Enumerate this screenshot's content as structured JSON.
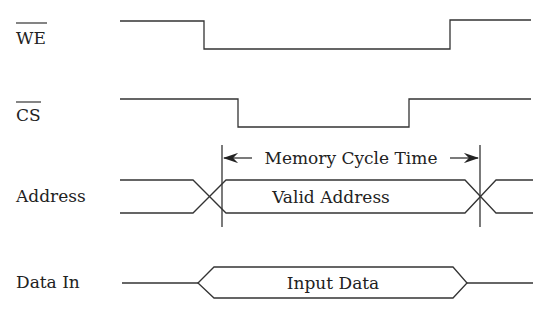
{
  "diagram": {
    "type": "timing-diagram",
    "signals": [
      {
        "name": "WE",
        "active_low": true,
        "label": "WE"
      },
      {
        "name": "CS",
        "active_low": true,
        "label": "CS"
      },
      {
        "name": "Address",
        "active_low": false,
        "label": "Address"
      },
      {
        "name": "Data In",
        "active_low": false,
        "label": "Data In"
      }
    ],
    "bus_labels": {
      "address": "Valid Address",
      "data": "Input Data"
    },
    "annotation": {
      "cycle_time": "Memory Cycle Time"
    }
  }
}
